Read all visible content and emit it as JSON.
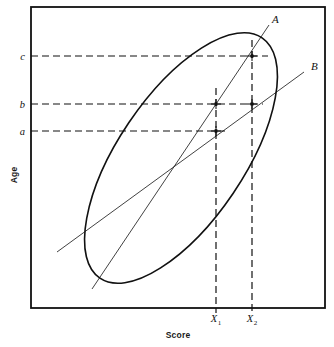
{
  "figure": {
    "background_color": "#ffffff",
    "ink_color": "#111111"
  },
  "axes": {
    "x_label": "Score",
    "y_label": "Age",
    "frame": {
      "left": 31,
      "top": 7,
      "right": 325,
      "bottom": 308
    }
  },
  "y_ticks": [
    {
      "label": "c",
      "y": 56
    },
    {
      "label": "b",
      "y": 104
    },
    {
      "label": "a",
      "y": 131
    }
  ],
  "x_ticks": [
    {
      "label": "X",
      "subscript": "1",
      "x": 216
    },
    {
      "label": "X",
      "subscript": "2",
      "x": 252
    }
  ],
  "ellipse": {
    "cx": 181,
    "cy": 158,
    "rx": 145,
    "ry": 63,
    "rotation_deg": -56,
    "stroke": "#111111",
    "stroke_width": 1.6,
    "fill": "none"
  },
  "lines": [
    {
      "name": "A",
      "label": "A",
      "label_x": 272,
      "label_y": 23,
      "x1": 92,
      "y1": 289,
      "x2": 269,
      "y2": 25,
      "stroke": "#111111",
      "stroke_width": 0.8
    },
    {
      "name": "B",
      "label": "B",
      "label_x": 311,
      "label_y": 70,
      "x1": 57,
      "y1": 252,
      "x2": 304,
      "y2": 72,
      "stroke": "#111111",
      "stroke_width": 0.8
    }
  ],
  "dashed_horizontals": [
    {
      "name": "c-line",
      "y": 56,
      "x1": 31,
      "x2": 268
    },
    {
      "name": "b-line",
      "y": 104,
      "x1": 31,
      "x2": 263
    },
    {
      "name": "a-line",
      "y": 131,
      "x1": 31,
      "x2": 228
    }
  ],
  "dashed_verticals": [
    {
      "name": "x1-line",
      "x": 216,
      "y1": 88,
      "y2": 313
    },
    {
      "name": "x2-line",
      "x": 252,
      "y1": 40,
      "y2": 313
    }
  ],
  "marked_points": [
    {
      "name": "point-x2-c",
      "x": 252,
      "y": 56
    },
    {
      "name": "point-x1-b",
      "x": 216,
      "y": 104
    },
    {
      "name": "point-x2-b",
      "x": 252,
      "y": 104
    },
    {
      "name": "point-x1-a",
      "x": 216,
      "y": 131
    }
  ]
}
